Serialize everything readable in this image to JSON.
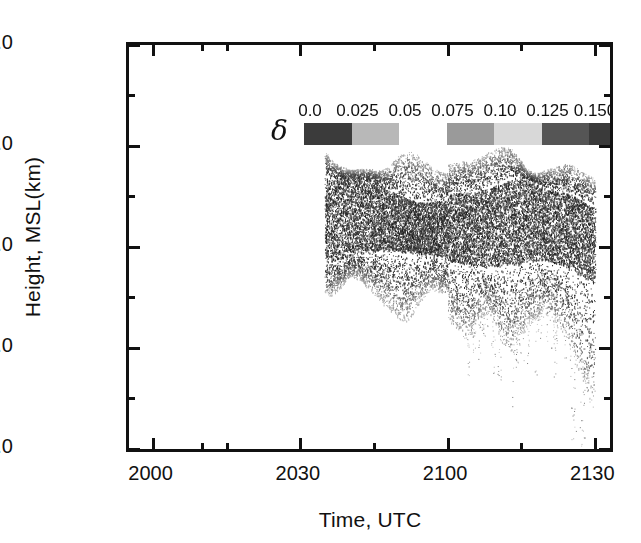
{
  "chart_data": {
    "type": "scatter",
    "title": "",
    "xlabel": "Time, UTC",
    "ylabel": "Height, MSL(km)",
    "xlim": [
      1955,
      2133
    ],
    "ylim": [
      2.0,
      6.0
    ],
    "grid": false,
    "x_major_ticks": [
      "2000",
      "2030",
      "2100",
      "2130"
    ],
    "x_major_values": [
      2000,
      2030,
      2100,
      2130
    ],
    "x_minor_values": [
      1970,
      2015,
      2045,
      2115
    ],
    "y_major_ticks": [
      "2.0",
      "3.0",
      "4.0",
      "5.0",
      "6.0"
    ],
    "y_major_values": [
      2.0,
      3.0,
      4.0,
      5.0,
      6.0
    ],
    "y_minor_values": [
      2.5,
      3.5,
      4.5,
      5.5
    ],
    "colorbar": {
      "variable": "δ",
      "tick_labels": [
        "0.0",
        "0.025",
        "0.05",
        "0.075",
        "0.10",
        "0.125",
        "0.150",
        "0.175",
        "0.20"
      ],
      "tick_values": [
        0.0,
        0.025,
        0.05,
        0.075,
        0.1,
        0.125,
        0.15,
        0.175,
        0.2
      ],
      "segment_colors": [
        "#3b3b3b",
        "#b8b8b8",
        "#ffffff",
        "#9a9a9a",
        "#d8d8d8",
        "#555555",
        "#3a3a3a",
        "#0d0d0d"
      ],
      "gap_segment_index": 2
    },
    "series": [
      {
        "name": "boundary-layer echo intensity",
        "description": "Dense vertical-profile scatter of radar backscatter shading delta versus height and time",
        "envelope_top_x": [
          1995,
          2000,
          2004,
          2008,
          2012,
          2016,
          2020,
          2024,
          2028,
          2032,
          2036,
          2040,
          2044,
          2048,
          2052,
          2056,
          2100,
          2104,
          2108,
          2112,
          2116,
          2120,
          2124,
          2128,
          2130
        ],
        "envelope_top_y": [
          4.85,
          4.75,
          4.95,
          4.7,
          5.05,
          4.95,
          4.8,
          4.85,
          4.78,
          5.05,
          4.9,
          4.8,
          4.82,
          4.72,
          4.75,
          4.8,
          4.88,
          4.9,
          4.95,
          4.92,
          4.85,
          4.95,
          4.88,
          4.7,
          4.62
        ],
        "envelope_core_top_x": [
          1995,
          2005,
          2015,
          2025,
          2035,
          2045,
          2055,
          2105,
          2115,
          2125,
          2130
        ],
        "envelope_core_top_y": [
          4.5,
          4.45,
          4.55,
          4.5,
          4.62,
          4.52,
          4.5,
          4.58,
          4.62,
          4.6,
          4.45
        ],
        "envelope_core_bot_x": [
          1995,
          2005,
          2015,
          2025,
          2035,
          2045,
          2055,
          2105,
          2115,
          2125,
          2130
        ],
        "envelope_core_bot_y": [
          3.95,
          3.88,
          3.92,
          3.9,
          3.95,
          3.88,
          3.9,
          3.85,
          3.8,
          3.85,
          3.75
        ],
        "envelope_bot_x": [
          1995,
          2000,
          2004,
          2008,
          2012,
          2016,
          2020,
          2024,
          2028,
          2032,
          2036,
          2040,
          2044,
          2048,
          2052,
          2056,
          2100,
          2104,
          2108,
          2112,
          2116,
          2120,
          2124,
          2128,
          2130
        ],
        "envelope_bot_y": [
          3.55,
          3.62,
          3.48,
          3.55,
          3.5,
          3.58,
          3.45,
          3.6,
          3.4,
          3.52,
          3.35,
          3.55,
          3.48,
          3.5,
          3.42,
          3.55,
          3.3,
          3.05,
          3.38,
          3.1,
          3.25,
          3.15,
          2.95,
          2.45,
          2.25
        ]
      }
    ]
  },
  "axis": {
    "y_title": "Height, MSL(km)",
    "x_title": "Time, UTC"
  },
  "legend": {
    "symbol": "δ"
  }
}
